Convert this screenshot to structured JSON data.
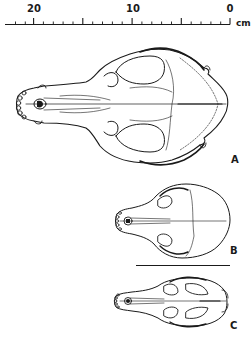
{
  "figure": {
    "type": "anatomical-illustration",
    "scale_bar": {
      "unit": "cm",
      "labels": [
        {
          "text": "20",
          "value": 20
        },
        {
          "text": "10",
          "value": 10
        },
        {
          "text": "0",
          "value": 0
        }
      ],
      "minor_tick_interval_cm": 1,
      "major_tick_interval_cm": 5,
      "range_cm": [
        0,
        23
      ]
    },
    "panels": [
      {
        "label": "A"
      },
      {
        "label": "B"
      },
      {
        "label": "C"
      }
    ],
    "divider": "horizontal rule between panels B and C",
    "line_color": "#1a1a1a",
    "background": "#ffffff"
  }
}
